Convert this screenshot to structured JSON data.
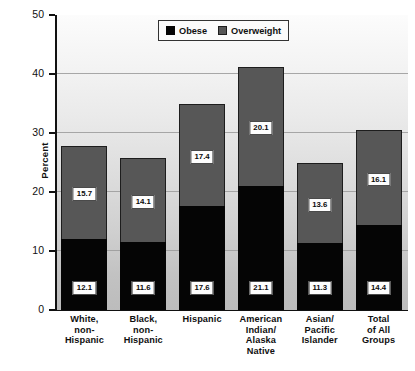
{
  "chart_data": {
    "type": "bar",
    "subtype": "stacked-bar",
    "title": "",
    "xlabel": "",
    "ylabel": "Percent",
    "ylim": [
      0,
      50
    ],
    "yticks": [
      0,
      10,
      20,
      30,
      40,
      50
    ],
    "ytick_labels": [
      "0",
      "10",
      "20",
      "30",
      "40",
      "50"
    ],
    "grid": true,
    "grid_axis": "y",
    "legend_position": "top-center",
    "categories": [
      "White, non-Hispanic",
      "Black, non-Hispanic",
      "Hispanic",
      "American Indian/ Alaska Native",
      "Asian/ Pacific Islander",
      "Total of All Groups"
    ],
    "category_lines": [
      [
        "White,",
        "non-",
        "Hispanic"
      ],
      [
        "Black,",
        "non-",
        "Hispanic"
      ],
      [
        "Hispanic"
      ],
      [
        "American",
        "Indian/",
        "Alaska",
        "Native"
      ],
      [
        "Asian/",
        "Pacific",
        "Islander"
      ],
      [
        "Total",
        "of All",
        "Groups"
      ]
    ],
    "series": [
      {
        "name": "Obese",
        "color": "#050505",
        "values": [
          12.1,
          11.6,
          17.6,
          21.1,
          11.3,
          14.4
        ],
        "labels": [
          "12.1",
          "11.6",
          "17.6",
          "21.1",
          "11.3",
          "14.4"
        ]
      },
      {
        "name": "Overweight",
        "color": "#575757",
        "values": [
          15.7,
          14.1,
          17.4,
          20.1,
          13.6,
          16.1
        ],
        "labels": [
          "15.7",
          "14.1",
          "17.4",
          "20.1",
          "13.6",
          "16.1"
        ]
      }
    ],
    "totals": [
      27.8,
      25.7,
      35.0,
      41.2,
      24.9,
      30.5
    ]
  },
  "legend": {
    "items": [
      {
        "label": "Obese",
        "color": "#050505"
      },
      {
        "label": "Overweight",
        "color": "#575757"
      }
    ]
  },
  "axis": {
    "y_title": "Percent"
  }
}
